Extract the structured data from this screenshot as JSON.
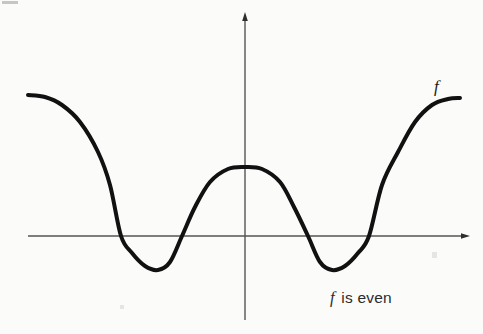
{
  "figure": {
    "background_color": "#fbfbfa",
    "curve_color": "#111111",
    "axis_color": "#555555",
    "caption": "f is even",
    "caption_symbol": "f",
    "caption_rest": " is even",
    "curve_label": "f"
  },
  "chart_data": {
    "type": "line",
    "title": "",
    "subtitle": "",
    "xlabel": "",
    "ylabel": "",
    "annotations": [
      {
        "text": "f",
        "role": "curve-label",
        "x_px": 439,
        "y_px": 88
      },
      {
        "text": "f is even",
        "role": "caption",
        "x_px": 370,
        "y_px": 300
      }
    ],
    "legend": [],
    "legend_position": "none",
    "grid": false,
    "axes": {
      "x_axis": {
        "y_px": 236,
        "x_start_px": 28,
        "x_end_px": 468,
        "arrow": "right",
        "color": "#555555"
      },
      "y_axis": {
        "x_px": 245,
        "y_start_px": 320,
        "y_end_px": 14,
        "arrow": "up",
        "color": "#555555"
      },
      "origin_px": [
        245,
        236
      ],
      "ticks": [],
      "tick_labels": []
    },
    "xlim": [
      28,
      468
    ],
    "ylim": [
      320,
      14
    ],
    "series": [
      {
        "name": "f",
        "color": "#111111",
        "linewidth_px": 4,
        "x": [
          28,
          45,
          62,
          80,
          98,
          110,
          121,
          132,
          145,
          158,
          170,
          182,
          195,
          210,
          228,
          245,
          262,
          280,
          294,
          308,
          320,
          332,
          345,
          358,
          369,
          382,
          398,
          415,
          432,
          448,
          460
        ],
        "y": [
          95,
          97,
          105,
          122,
          152,
          185,
          236,
          253,
          266,
          270,
          262,
          236,
          207,
          182,
          169,
          167,
          169,
          182,
          207,
          236,
          262,
          270,
          266,
          253,
          236,
          185,
          152,
          122,
          105,
          99,
          98
        ]
      }
    ],
    "features": {
      "central_maximum": {
        "x_px": 245,
        "y_px": 167
      },
      "left_minimum": {
        "x_px": 158,
        "y_px": 270
      },
      "right_minimum": {
        "x_px": 332,
        "y_px": 270
      },
      "zero_crossings_px": [
        121,
        182,
        308,
        369
      ],
      "symmetry": "even (mirror about the y-axis)"
    }
  }
}
